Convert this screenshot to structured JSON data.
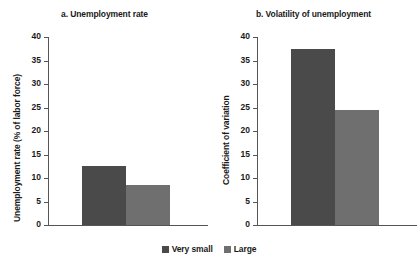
{
  "chart_data": {
    "type": "bar",
    "title": "",
    "categories": [
      "Very small",
      "Large"
    ],
    "legend": [
      "Very small",
      "Large"
    ],
    "legend_position": "bottom-center",
    "grid": false,
    "colors": {
      "very_small": "#4a4a4a",
      "large": "#6f6f6f"
    },
    "panels": [
      {
        "id": "a",
        "title": "a. Unemployment rate",
        "xlabel": "",
        "ylabel": "Unemployment rate (% of labor force)",
        "ylim": [
          0,
          40
        ],
        "yticks": [
          0,
          5,
          10,
          15,
          20,
          25,
          30,
          35,
          40
        ],
        "ytick_labels": [
          "0",
          "5",
          "10",
          "15",
          "20",
          "25",
          "30",
          "35",
          "40"
        ],
        "series": [
          {
            "name": "Very small",
            "value": 12.6
          },
          {
            "name": "Large",
            "value": 8.5
          }
        ]
      },
      {
        "id": "b",
        "title": "b. Volatility of unemployment",
        "xlabel": "",
        "ylabel": "Coefficient of variation",
        "ylim": [
          0,
          40
        ],
        "yticks": [
          0,
          5,
          10,
          15,
          20,
          25,
          30,
          35,
          40
        ],
        "ytick_labels": [
          "0",
          "5",
          "10",
          "15",
          "20",
          "25",
          "30",
          "35",
          "40"
        ],
        "series": [
          {
            "name": "Very small",
            "value": 37.4
          },
          {
            "name": "Large",
            "value": 24.5
          }
        ]
      }
    ]
  }
}
